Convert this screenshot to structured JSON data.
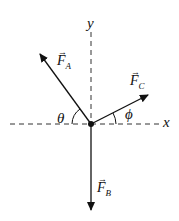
{
  "diagram": {
    "axes": {
      "x_label": "x",
      "y_label": "y"
    },
    "vectors": [
      {
        "name": "F",
        "subscript": "A",
        "direction": "up-left"
      },
      {
        "name": "F",
        "subscript": "B",
        "direction": "down"
      },
      {
        "name": "F",
        "subscript": "C",
        "direction": "up-right"
      }
    ],
    "angles": [
      {
        "symbol": "θ",
        "between": "F_A and negative x-axis"
      },
      {
        "symbol": "ϕ",
        "between": "F_C and positive x-axis"
      }
    ],
    "arrow_symbol": "→",
    "colors": {
      "line": "#111111",
      "background": "#ffffff"
    }
  }
}
